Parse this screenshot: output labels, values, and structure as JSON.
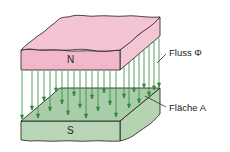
{
  "diagram": {
    "north_pole_label": "N",
    "south_pole_label": "S",
    "flux_label": "Fluss Φ",
    "area_label": "Fläche A",
    "colors": {
      "north_top": "#f4c4d2",
      "north_front": "#f0b8c8",
      "north_side": "#f3c6d3",
      "south_top": "#a9cda9",
      "south_front": "#b8d6b5",
      "south_side": "#b5d2b1",
      "field_lines": "#2e8a3a",
      "outline": "#1a1a1a"
    },
    "field_line_count": 24
  }
}
